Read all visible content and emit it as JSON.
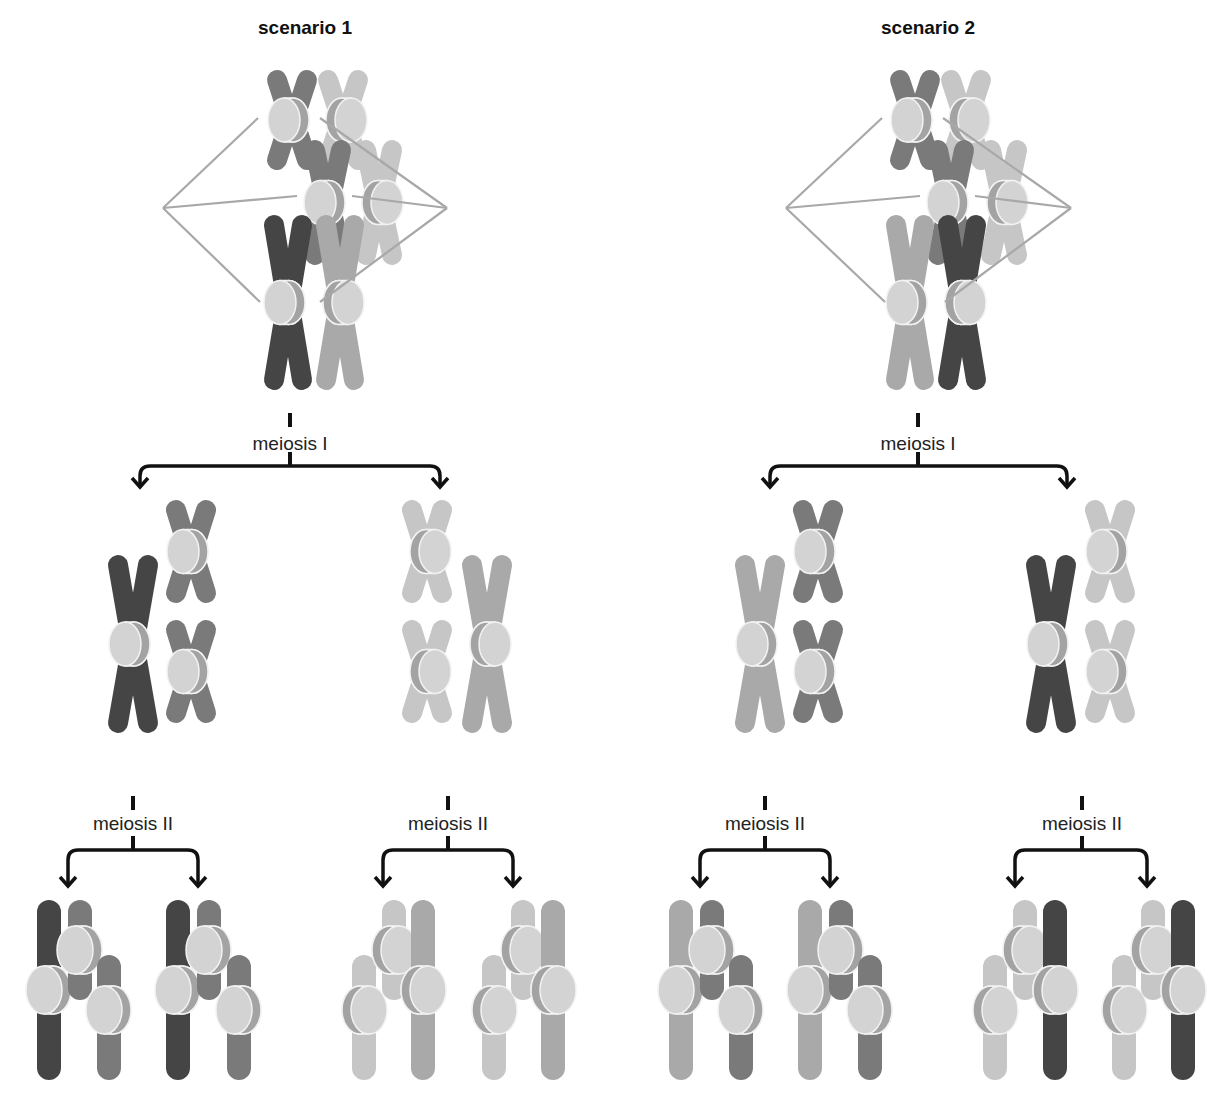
{
  "diagram": {
    "colors": {
      "dark": "#454545",
      "mdark": "#7a7a7a",
      "medium": "#a9a9a9",
      "light": "#c6c6c6",
      "cen_face": "#d3d3d3",
      "cen_side": "#a3a3a3",
      "cen_stroke": "#f2f2f2",
      "spindle": "#a8a8a8",
      "arrow": "#111111"
    },
    "scenarios": [
      {
        "title": "scenario 1",
        "title_pos": [
          305,
          28
        ],
        "metaphase": {
          "spindle_poles": [
            [
              163,
              208
            ],
            [
              447,
              208
            ]
          ],
          "chromosomes": [
            {
              "x": 267,
              "y": 70,
              "w": 50,
              "h": 100,
              "color": "mdark",
              "cen": "left"
            },
            {
              "x": 318,
              "y": 70,
              "w": 50,
              "h": 100,
              "color": "light",
              "cen": "right"
            },
            {
              "x": 305,
              "y": 140,
              "w": 46,
              "h": 125,
              "color": "mdark",
              "cen": "left"
            },
            {
              "x": 356,
              "y": 140,
              "w": 46,
              "h": 125,
              "color": "light",
              "cen": "right"
            },
            {
              "x": 264,
              "y": 215,
              "w": 48,
              "h": 175,
              "color": "dark",
              "cen": "left"
            },
            {
              "x": 316,
              "y": 215,
              "w": 48,
              "h": 175,
              "color": "medium",
              "cen": "right"
            }
          ],
          "spindle_targets": [
            [
              258,
              118
            ],
            [
              297,
              196
            ],
            [
              260,
              302
            ],
            [
              320,
              118
            ],
            [
              352,
              196
            ],
            [
              320,
              302
            ]
          ]
        },
        "meiosis1": {
          "label": "meiosis I",
          "stem": [
            290,
            413,
            466
          ],
          "branch_x": [
            140,
            440
          ],
          "branch_y": 466,
          "arrow_y": 487,
          "label_pos": [
            290,
            444
          ],
          "cells": [
            [
              {
                "x": 108,
                "y": 555,
                "w": 50,
                "h": 178,
                "color": "dark",
                "cen": "left"
              },
              {
                "x": 166,
                "y": 500,
                "w": 50,
                "h": 103,
                "color": "mdark",
                "cen": "left"
              },
              {
                "x": 166,
                "y": 620,
                "w": 50,
                "h": 103,
                "color": "mdark",
                "cen": "left"
              }
            ],
            [
              {
                "x": 402,
                "y": 500,
                "w": 50,
                "h": 103,
                "color": "light",
                "cen": "right"
              },
              {
                "x": 402,
                "y": 620,
                "w": 50,
                "h": 103,
                "color": "light",
                "cen": "right"
              },
              {
                "x": 462,
                "y": 555,
                "w": 50,
                "h": 178,
                "color": "medium",
                "cen": "right"
              }
            ]
          ]
        },
        "meiosis2": [
          {
            "label": "meiosis II",
            "label_pos": [
              133,
              824
            ],
            "stem": [
              133,
              796,
              850
            ],
            "branch_x": [
              68,
              198
            ],
            "branch_y": 850,
            "arrow_y": 886,
            "cells": [
              [
                {
                  "x": 37,
                  "y": 900,
                  "h": 180,
                  "color": "dark",
                  "cen": "left",
                  "cy": 990
                },
                {
                  "x": 68,
                  "y": 900,
                  "h": 100,
                  "color": "mdark",
                  "cen": "left",
                  "cy": 950
                },
                {
                  "x": 97,
                  "y": 955,
                  "h": 125,
                  "color": "mdark",
                  "cen": "left",
                  "cy": 1010
                }
              ],
              [
                {
                  "x": 166,
                  "y": 900,
                  "h": 180,
                  "color": "dark",
                  "cen": "left",
                  "cy": 990
                },
                {
                  "x": 197,
                  "y": 900,
                  "h": 100,
                  "color": "mdark",
                  "cen": "left",
                  "cy": 950
                },
                {
                  "x": 227,
                  "y": 955,
                  "h": 125,
                  "color": "mdark",
                  "cen": "left",
                  "cy": 1010
                }
              ]
            ]
          },
          {
            "label": "meiosis II",
            "label_pos": [
              448,
              824
            ],
            "stem": [
              448,
              796,
              850
            ],
            "branch_x": [
              383,
              513
            ],
            "branch_y": 850,
            "arrow_y": 886,
            "cells": [
              [
                {
                  "x": 352,
                  "y": 955,
                  "h": 125,
                  "color": "light",
                  "cen": "right",
                  "cy": 1010
                },
                {
                  "x": 382,
                  "y": 900,
                  "h": 100,
                  "color": "light",
                  "cen": "right",
                  "cy": 950
                },
                {
                  "x": 411,
                  "y": 900,
                  "h": 180,
                  "color": "medium",
                  "cen": "right",
                  "cy": 990
                }
              ],
              [
                {
                  "x": 482,
                  "y": 955,
                  "h": 125,
                  "color": "light",
                  "cen": "right",
                  "cy": 1010
                },
                {
                  "x": 511,
                  "y": 900,
                  "h": 100,
                  "color": "light",
                  "cen": "right",
                  "cy": 950
                },
                {
                  "x": 541,
                  "y": 900,
                  "h": 180,
                  "color": "medium",
                  "cen": "right",
                  "cy": 990
                }
              ]
            ]
          }
        ]
      },
      {
        "title": "scenario 2",
        "title_pos": [
          928,
          28
        ],
        "metaphase": {
          "spindle_poles": [
            [
              786,
              208
            ],
            [
              1071,
              208
            ]
          ],
          "chromosomes": [
            {
              "x": 890,
              "y": 70,
              "w": 50,
              "h": 100,
              "color": "mdark",
              "cen": "left"
            },
            {
              "x": 941,
              "y": 70,
              "w": 50,
              "h": 100,
              "color": "light",
              "cen": "right"
            },
            {
              "x": 928,
              "y": 140,
              "w": 46,
              "h": 125,
              "color": "mdark",
              "cen": "left"
            },
            {
              "x": 981,
              "y": 140,
              "w": 46,
              "h": 125,
              "color": "light",
              "cen": "right"
            },
            {
              "x": 938,
              "y": 215,
              "w": 48,
              "h": 175,
              "color": "dark",
              "cen": "right"
            },
            {
              "x": 886,
              "y": 215,
              "w": 48,
              "h": 175,
              "color": "medium",
              "cen": "left"
            }
          ],
          "spindle_targets": [
            [
              882,
              118
            ],
            [
              920,
              196
            ],
            [
              885,
              302
            ],
            [
              943,
              118
            ],
            [
              975,
              196
            ],
            [
              945,
              302
            ]
          ]
        },
        "meiosis1": {
          "label": "meiosis I",
          "stem": [
            918,
            413,
            466
          ],
          "branch_x": [
            770,
            1067
          ],
          "branch_y": 466,
          "arrow_y": 487,
          "label_pos": [
            918,
            444
          ],
          "cells": [
            [
              {
                "x": 735,
                "y": 555,
                "w": 50,
                "h": 178,
                "color": "medium",
                "cen": "left"
              },
              {
                "x": 793,
                "y": 500,
                "w": 50,
                "h": 103,
                "color": "mdark",
                "cen": "left"
              },
              {
                "x": 793,
                "y": 620,
                "w": 50,
                "h": 103,
                "color": "mdark",
                "cen": "left"
              }
            ],
            [
              {
                "x": 1026,
                "y": 555,
                "w": 50,
                "h": 178,
                "color": "dark",
                "cen": "left"
              },
              {
                "x": 1085,
                "y": 500,
                "w": 50,
                "h": 103,
                "color": "light",
                "cen": "left"
              },
              {
                "x": 1085,
                "y": 620,
                "w": 50,
                "h": 103,
                "color": "light",
                "cen": "left"
              }
            ]
          ]
        },
        "meiosis2": [
          {
            "label": "meiosis II",
            "label_pos": [
              765,
              824
            ],
            "stem": [
              765,
              796,
              850
            ],
            "branch_x": [
              700,
              830
            ],
            "branch_y": 850,
            "arrow_y": 886,
            "cells": [
              [
                {
                  "x": 669,
                  "y": 900,
                  "h": 180,
                  "color": "medium",
                  "cen": "left",
                  "cy": 990
                },
                {
                  "x": 700,
                  "y": 900,
                  "h": 100,
                  "color": "mdark",
                  "cen": "left",
                  "cy": 950
                },
                {
                  "x": 729,
                  "y": 955,
                  "h": 125,
                  "color": "mdark",
                  "cen": "left",
                  "cy": 1010
                }
              ],
              [
                {
                  "x": 798,
                  "y": 900,
                  "h": 180,
                  "color": "medium",
                  "cen": "left",
                  "cy": 990
                },
                {
                  "x": 829,
                  "y": 900,
                  "h": 100,
                  "color": "mdark",
                  "cen": "left",
                  "cy": 950
                },
                {
                  "x": 858,
                  "y": 955,
                  "h": 125,
                  "color": "mdark",
                  "cen": "left",
                  "cy": 1010
                }
              ]
            ]
          },
          {
            "label": "meiosis II",
            "label_pos": [
              1082,
              824
            ],
            "stem": [
              1082,
              796,
              850
            ],
            "branch_x": [
              1015,
              1147
            ],
            "branch_y": 850,
            "arrow_y": 886,
            "cells": [
              [
                {
                  "x": 983,
                  "y": 955,
                  "h": 125,
                  "color": "light",
                  "cen": "right",
                  "cy": 1010
                },
                {
                  "x": 1013,
                  "y": 900,
                  "h": 100,
                  "color": "light",
                  "cen": "right",
                  "cy": 950
                },
                {
                  "x": 1043,
                  "y": 900,
                  "h": 180,
                  "color": "dark",
                  "cen": "right",
                  "cy": 990
                }
              ],
              [
                {
                  "x": 1112,
                  "y": 955,
                  "h": 125,
                  "color": "light",
                  "cen": "right",
                  "cy": 1010
                },
                {
                  "x": 1141,
                  "y": 900,
                  "h": 100,
                  "color": "light",
                  "cen": "right",
                  "cy": 950
                },
                {
                  "x": 1171,
                  "y": 900,
                  "h": 180,
                  "color": "dark",
                  "cen": "right",
                  "cy": 990
                }
              ]
            ]
          }
        ]
      }
    ]
  }
}
